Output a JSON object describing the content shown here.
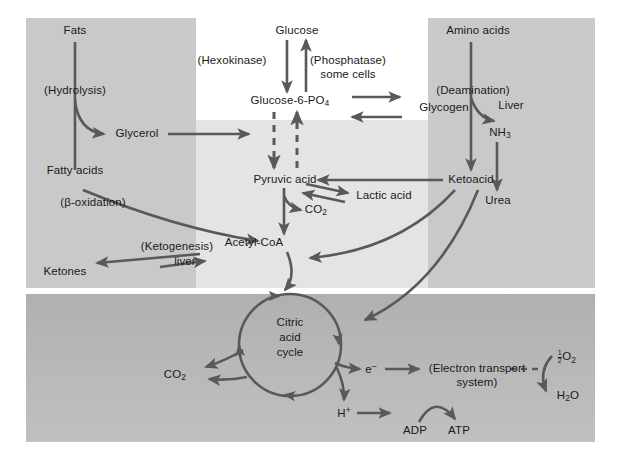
{
  "figure": {
    "background_color": "#ffffff",
    "panels": {
      "fats_panel_color": "#c9c9c9",
      "amino_panel_color": "#c9c9c9",
      "glycolysis_panel_color": "#e2e2e2",
      "mitochondrion_panel_color": "#b4b4b4",
      "arrow_color": "#595959",
      "text_color": "#1a1a1a"
    }
  },
  "labels": {
    "fats": "Fats",
    "hydrolysis": "(Hydrolysis)",
    "glycerol": "Glycerol",
    "fatty_acids": "Fatty acids",
    "beta_oxidation": "(β-oxidation)",
    "ketogenesis": "(Ketogenesis)",
    "liver_ketogenesis": "liver",
    "ketones": "Ketones",
    "glucose": "Glucose",
    "hexokinase": "(Hexokinase)",
    "phosphatase": "(Phosphatase)",
    "some_cells": "some cells",
    "glucose6po4": "Glucose-6-PO",
    "glucose6po4_sub": "4",
    "glycogen": "Glycogen",
    "pyruvic_acid": "Pyruvic acid",
    "lactic_acid": "Lactic acid",
    "co2_glycolysis": "CO",
    "co2_glycolysis_sub": "2",
    "acetyl_coa": "Acetyl-CoA",
    "amino_acids": "Amino acids",
    "deamination": "(Deamination)",
    "liver_deamination": "Liver",
    "nh3": "NH",
    "nh3_sub": "3",
    "ketoacid": "Ketoacid",
    "urea": "Urea",
    "citric_acid_cycle": "Citric\nacid\ncycle",
    "citric_line1": "Citric",
    "citric_line2": "acid",
    "citric_line3": "cycle",
    "co2_cycle": "CO",
    "co2_cycle_sub": "2",
    "electron": "e",
    "electron_sup": "–",
    "electron_transport": "(Electron transport",
    "electron_transport2": "system)",
    "proton": "H",
    "proton_sup": "+",
    "adp": "ADP",
    "atp": "ATP",
    "half_o2_num": "1",
    "half_o2_den": "2",
    "half_o2_rest": "O",
    "half_o2_sub": "2",
    "water": "H",
    "water_sub": "2",
    "water_rest": "O"
  },
  "pathways": [
    {
      "name": "fat-hydrolysis",
      "from": "Fats",
      "to": "Fatty acids / Glycerol",
      "style": "solid"
    },
    {
      "name": "glycerol-entry",
      "from": "Glycerol",
      "to": "Glycolysis intermediates",
      "style": "solid"
    },
    {
      "name": "beta-oxidation",
      "from": "Fatty acids",
      "to": "Acetyl-CoA",
      "style": "solid"
    },
    {
      "name": "ketogenesis",
      "from": "Acetyl-CoA",
      "to": "Ketones",
      "style": "reversible"
    },
    {
      "name": "hexokinase",
      "from": "Glucose",
      "to": "Glucose-6-PO4",
      "style": "solid"
    },
    {
      "name": "phosphatase",
      "from": "Glucose-6-PO4",
      "to": "Glucose",
      "style": "solid"
    },
    {
      "name": "glycogenesis",
      "from": "Glucose-6-PO4",
      "to": "Glycogen",
      "style": "reversible"
    },
    {
      "name": "glycolysis",
      "from": "Glucose-6-PO4",
      "to": "Pyruvic acid",
      "style": "dashed"
    },
    {
      "name": "gluconeogenesis",
      "from": "Pyruvic acid",
      "to": "Glucose-6-PO4",
      "style": "dashed"
    },
    {
      "name": "lactate",
      "from": "Pyruvic acid",
      "to": "Lactic acid",
      "style": "reversible"
    },
    {
      "name": "pyruvate-decarboxylation",
      "from": "Pyruvic acid",
      "to": "CO2 + Acetyl-CoA",
      "style": "solid"
    },
    {
      "name": "deamination",
      "from": "Amino acids",
      "to": "Ketoacid + NH3",
      "style": "solid"
    },
    {
      "name": "urea-cycle",
      "from": "NH3",
      "to": "Urea",
      "style": "solid"
    },
    {
      "name": "ketoacid-to-acetyl",
      "from": "Ketoacid",
      "to": "Acetyl-CoA",
      "style": "solid"
    },
    {
      "name": "ketoacid-to-cycle",
      "from": "Ketoacid",
      "to": "Citric acid cycle",
      "style": "solid"
    },
    {
      "name": "ketoacid-to-pyruvate",
      "from": "Ketoacid",
      "to": "Pyruvic acid",
      "style": "solid"
    },
    {
      "name": "acetyl-to-cycle",
      "from": "Acetyl-CoA",
      "to": "Citric acid cycle",
      "style": "solid"
    },
    {
      "name": "cycle-co2",
      "from": "Citric acid cycle",
      "to": "CO2",
      "style": "solid"
    },
    {
      "name": "cycle-electrons",
      "from": "Citric acid cycle",
      "to": "e-",
      "style": "solid"
    },
    {
      "name": "cycle-protons",
      "from": "Citric acid cycle",
      "to": "H+",
      "style": "solid"
    },
    {
      "name": "ets",
      "from": "e-",
      "to": "(Electron transport system)",
      "style": "solid"
    },
    {
      "name": "oxygen-reduction",
      "from": "1/2 O2",
      "to": "H2O",
      "style": "solid"
    },
    {
      "name": "ets-dashed",
      "from": "(Electron transport system)",
      "to": "1/2 O2",
      "style": "dashed"
    },
    {
      "name": "phosphorylation",
      "from": "ADP",
      "to": "ATP",
      "style": "curved"
    }
  ]
}
